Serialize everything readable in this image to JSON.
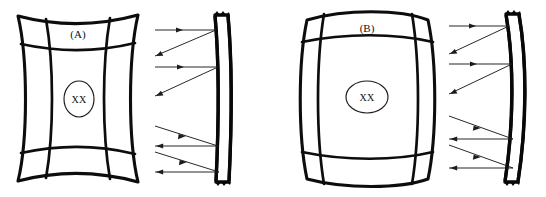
{
  "figure": {
    "background_color": "#ffffff",
    "ink_color": "#0d0d0d",
    "ray_color": "#1c1c1c",
    "width": 546,
    "height": 197
  },
  "panels": [
    {
      "id": "A",
      "label": "(A)",
      "region_label": "XX",
      "grid_distortion": "concave",
      "grid_rows": 3,
      "grid_cols": 3,
      "marker_shape": "ellipse-tall",
      "membrane_profile": "slight-curve",
      "ray_count": 4,
      "incident_ray_count": 2,
      "reflected_ray_count": 2
    },
    {
      "id": "B",
      "label": "(B)",
      "region_label": "XX",
      "grid_distortion": "convex",
      "grid_rows": 3,
      "grid_cols": 3,
      "marker_shape": "ellipse-wide",
      "membrane_profile": "bowed-curve",
      "ray_count": 4,
      "incident_ray_count": 2,
      "reflected_ray_count": 2
    }
  ],
  "icons": {
    "arrowhead": "arrow-head-icon",
    "membrane": "membrane-strip-icon",
    "grid": "deformed-grid-icon"
  }
}
